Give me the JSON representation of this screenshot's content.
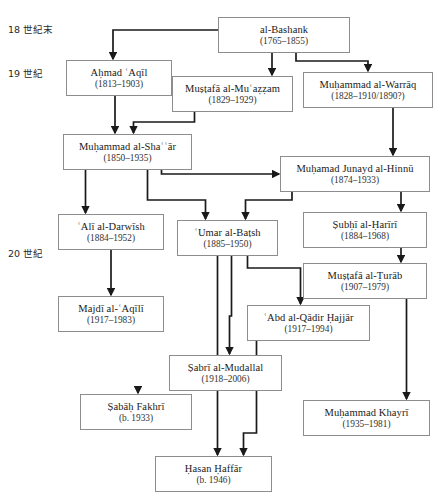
{
  "diagram": {
    "type": "genealogy-tree",
    "title_fragment": "",
    "era_labels": [
      {
        "id": "era-18",
        "text": "18 世紀末",
        "x": 8,
        "y": 22
      },
      {
        "id": "era-19",
        "text": "19 世紀",
        "x": 8,
        "y": 66
      },
      {
        "id": "era-20",
        "text": "20 世紀",
        "x": 8,
        "y": 246
      }
    ],
    "nodes": [
      {
        "id": "al-bashank",
        "name": "al-Bashank",
        "dates": "(1765–1855)",
        "x": 218,
        "y": 17,
        "w": 132,
        "h": 36
      },
      {
        "id": "ahmad-aqil",
        "name": "Aḥmad ʿAqīl",
        "dates": "(1813–1903)",
        "x": 66,
        "y": 60,
        "w": 106,
        "h": 36
      },
      {
        "id": "mustafa-muazzam",
        "name": "Muṣṭafā al-Muʿaẓẓam",
        "dates": "(1829–1929)",
        "x": 172,
        "y": 76,
        "w": 121,
        "h": 36
      },
      {
        "id": "muhammad-warraq",
        "name": "Muḥammad al-Warrāq",
        "dates": "(1828–1910/1890?)",
        "x": 303,
        "y": 72,
        "w": 130,
        "h": 36
      },
      {
        "id": "muhammad-shaar",
        "name": "Muḥammad al-Shaʿʿār",
        "dates": "(1850–1935)",
        "x": 63,
        "y": 134,
        "w": 129,
        "h": 36
      },
      {
        "id": "muhamad-hinnu",
        "name": "Muḥamad Junayd al-Hinnū",
        "dates": "(1874–1933)",
        "x": 280,
        "y": 156,
        "w": 150,
        "h": 36
      },
      {
        "id": "ali-darwish",
        "name": "ʿAlī al-Darwīsh",
        "dates": "(1884–1952)",
        "x": 58,
        "y": 214,
        "w": 106,
        "h": 36
      },
      {
        "id": "umar-batsh",
        "name": "ʿUmar al-Baṭsh",
        "dates": "(1885–1950)",
        "x": 177,
        "y": 220,
        "w": 101,
        "h": 36
      },
      {
        "id": "subhi-hariri",
        "name": "Ṣubḥī al-Ḥarīrī",
        "dates": "(1884–1968)",
        "x": 303,
        "y": 212,
        "w": 124,
        "h": 36
      },
      {
        "id": "mustafa-turab",
        "name": "Muṣṭafā al-Ṭurāb",
        "dates": "(1907–1979)",
        "x": 303,
        "y": 263,
        "w": 124,
        "h": 36
      },
      {
        "id": "majdi-aqili",
        "name": "Majdī al-ʿAqīlī",
        "dates": "(1917–1983)",
        "x": 58,
        "y": 296,
        "w": 106,
        "h": 36
      },
      {
        "id": "abd-qadir-hajjar",
        "name": "ʿAbd al-Qādir Ḥajjār",
        "dates": "(1917–1994)",
        "x": 247,
        "y": 305,
        "w": 123,
        "h": 36
      },
      {
        "id": "sabri-mudallal",
        "name": "Ṣabrī al-Mudallal",
        "dates": "(1918–2006)",
        "x": 169,
        "y": 355,
        "w": 113,
        "h": 36
      },
      {
        "id": "sabah-fakhri",
        "name": "Ṣabāḥ Fakhrī",
        "dates": "(b. 1933)",
        "x": 80,
        "y": 394,
        "w": 112,
        "h": 36
      },
      {
        "id": "muhammad-khayri",
        "name": "Muḥammad Khayrī",
        "dates": "(1935–1981)",
        "x": 303,
        "y": 400,
        "w": 127,
        "h": 36
      },
      {
        "id": "hasan-haffar",
        "name": "Ḥasan Ḥaffār",
        "dates": "(b. 1946)",
        "x": 155,
        "y": 456,
        "w": 117,
        "h": 36
      }
    ],
    "edges": [
      {
        "id": "e-bashank-ahmad",
        "from": "al-bashank",
        "to": "ahmad-aqil"
      },
      {
        "id": "e-bashank-mustafa",
        "from": "al-bashank",
        "to": "mustafa-muazzam"
      },
      {
        "id": "e-bashank-warraq",
        "from": "al-bashank",
        "to": "muhammad-warraq"
      },
      {
        "id": "e-ahmad-shaar",
        "from": "ahmad-aqil",
        "to": "muhammad-shaar"
      },
      {
        "id": "e-mustafa-shaar",
        "from": "mustafa-muazzam",
        "to": "muhammad-shaar"
      },
      {
        "id": "e-warraq-hinnu",
        "from": "muhammad-warraq",
        "to": "muhamad-hinnu"
      },
      {
        "id": "e-shaar-hinnu",
        "from": "muhammad-shaar",
        "to": "muhamad-hinnu"
      },
      {
        "id": "e-shaar-darwish",
        "from": "muhammad-shaar",
        "to": "ali-darwish"
      },
      {
        "id": "e-shaar-umar",
        "from": "muhammad-shaar",
        "to": "umar-batsh"
      },
      {
        "id": "e-hinnu-umar",
        "from": "muhamad-hinnu",
        "to": "umar-batsh"
      },
      {
        "id": "e-hinnu-subhi",
        "from": "muhamad-hinnu",
        "to": "subhi-hariri"
      },
      {
        "id": "e-subhi-turab",
        "from": "subhi-hariri",
        "to": "mustafa-turab"
      },
      {
        "id": "e-darwish-majdi",
        "from": "ali-darwish",
        "to": "majdi-aqili"
      },
      {
        "id": "e-umar-hajjar",
        "from": "umar-batsh",
        "to": "abd-qadir-hajjar"
      },
      {
        "id": "e-umar-sabri",
        "from": "umar-batsh",
        "to": "sabri-mudallal"
      },
      {
        "id": "e-umar-haffar",
        "from": "umar-batsh",
        "to": "hasan-haffar"
      },
      {
        "id": "e-turab-khayri",
        "from": "mustafa-turab",
        "to": "muhammad-khayri"
      },
      {
        "id": "e-sabri-sabah",
        "from": "sabri-mudallal",
        "to": "sabah-fakhri"
      },
      {
        "id": "e-hajjar-haffar",
        "from": "abd-qadir-hajjar",
        "to": "hasan-haffar"
      }
    ],
    "colors": {
      "box_border": "#8d8d8d",
      "box_fill": "#ffffff",
      "edge": "#1a1a1a",
      "text": "#1a1a1a",
      "background": "#ffffff"
    }
  }
}
